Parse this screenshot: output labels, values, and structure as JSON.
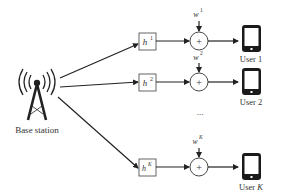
{
  "diagram": {
    "base_station": {
      "label": "Base station"
    },
    "channels": [
      {
        "symbol": "h",
        "index": "1"
      },
      {
        "symbol": "h",
        "index": "2"
      },
      {
        "symbol": "h",
        "index": "K"
      }
    ],
    "noises": [
      {
        "symbol": "w",
        "index": "1"
      },
      {
        "symbol": "w",
        "index": "2"
      },
      {
        "symbol": "w",
        "index": "K"
      }
    ],
    "adder_symbol": "+",
    "users": [
      {
        "label": "User 1"
      },
      {
        "label": "User 2"
      },
      {
        "label_prefix": "User ",
        "label_index": "K"
      }
    ],
    "ellipsis": "..."
  },
  "colors": {
    "stroke": "#222222",
    "text": "#333333",
    "background": "#ffffff"
  }
}
